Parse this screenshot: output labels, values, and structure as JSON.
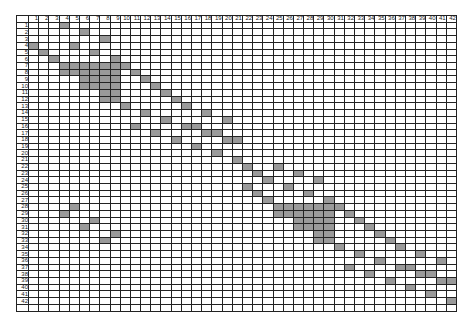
{
  "matrix": {
    "size": 42,
    "column_labels": [
      "1",
      "2",
      "3",
      "4",
      "5",
      "6",
      "7",
      "8",
      "9",
      "10",
      "11",
      "12",
      "13",
      "14",
      "15",
      "16",
      "17",
      "18",
      "19",
      "20",
      "21",
      "22",
      "23",
      "24",
      "25",
      "26",
      "27",
      "28",
      "29",
      "30",
      "31",
      "32",
      "33",
      "34",
      "35",
      "36",
      "37",
      "38",
      "39",
      "40",
      "41",
      "42"
    ],
    "row_labels": [
      "1",
      "2",
      "3",
      "4",
      "5",
      "6",
      "7",
      "8",
      "9",
      "10",
      "11",
      "12",
      "13",
      "14",
      "15",
      "16",
      "17",
      "18",
      "19",
      "20",
      "21",
      "22",
      "23",
      "24",
      "25",
      "26",
      "27",
      "28",
      "29",
      "30",
      "31",
      "32",
      "33",
      "34",
      "35",
      "36",
      "37",
      "38",
      "39",
      "40",
      "41",
      "42",
      ""
    ],
    "shaded_color": "#9a9a9a",
    "empty_color": "#ffffff",
    "grid_color": "#222222",
    "shaded_cells": {
      "1": [
        4
      ],
      "2": [
        6
      ],
      "3": [
        8
      ],
      "4": [
        1,
        5
      ],
      "5": [
        2,
        7
      ],
      "6": [
        3,
        9
      ],
      "7": [
        4,
        5,
        6,
        7,
        8,
        9,
        10
      ],
      "8": [
        4,
        5,
        6,
        7,
        8,
        9,
        11
      ],
      "9": [
        6,
        7,
        8,
        9,
        12
      ],
      "10": [
        6,
        7,
        8,
        9,
        13
      ],
      "11": [
        8,
        9,
        14
      ],
      "12": [
        8,
        9,
        15
      ],
      "13": [
        10,
        16
      ],
      "14": [
        12,
        18
      ],
      "15": [
        14,
        20
      ],
      "16": [
        11,
        16,
        17
      ],
      "17": [
        13,
        18,
        19
      ],
      "18": [
        15,
        20,
        21
      ],
      "19": [
        17
      ],
      "20": [
        19
      ],
      "21": [
        21
      ],
      "22": [
        22,
        25
      ],
      "23": [
        23,
        27
      ],
      "24": [
        24,
        29
      ],
      "25": [
        22,
        26
      ],
      "26": [
        23,
        28
      ],
      "27": [
        24,
        30
      ],
      "28": [
        5,
        25,
        26,
        27,
        28,
        29,
        30,
        31
      ],
      "29": [
        4,
        25,
        26,
        27,
        28,
        29,
        30,
        32
      ],
      "30": [
        7,
        27,
        28,
        29,
        30,
        33
      ],
      "31": [
        6,
        27,
        28,
        29,
        30,
        34
      ],
      "32": [
        9,
        29,
        30,
        35
      ],
      "33": [
        8,
        29,
        30,
        36
      ],
      "34": [
        31,
        37
      ],
      "35": [
        33,
        39
      ],
      "36": [
        35,
        41
      ],
      "37": [
        32,
        37,
        38
      ],
      "38": [
        34,
        39,
        40
      ],
      "39": [
        36,
        41,
        42
      ],
      "40": [
        38
      ],
      "41": [
        40
      ],
      "42": [
        42
      ]
    }
  }
}
